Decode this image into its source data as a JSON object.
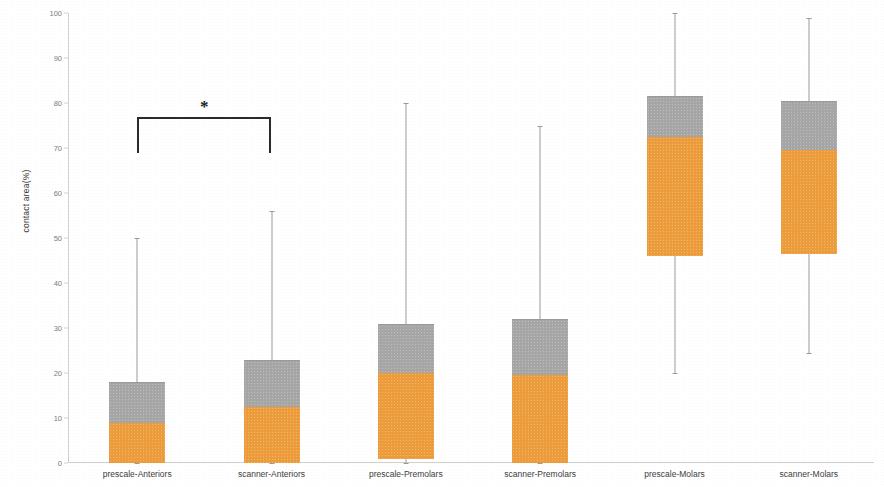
{
  "chart_data": {
    "type": "box",
    "title": "",
    "xlabel": "",
    "ylabel": "contact area(%)",
    "ylim": [
      0,
      100
    ],
    "ytick_step": 10,
    "yticks": [
      0,
      10,
      20,
      30,
      40,
      50,
      60,
      70,
      80,
      90,
      100
    ],
    "grid": false,
    "legend": "none",
    "colors": {
      "upper_box": "#a6a6a6",
      "lower_box": "#ed9c3c",
      "whisker": "#9b9b9b",
      "axis": "#d2d2d2",
      "tick_label": "#7d7d7d",
      "category_label": "#3c3c3c",
      "annotation": "#1d1d1d"
    },
    "categories": [
      "prescale-Anteriors",
      "scanner-Anteriors",
      "prescale-Premolars",
      "scanner-Premolars",
      "prescale-Molars",
      "scanner-Molars"
    ],
    "boxes": [
      {
        "category": "prescale-Anteriors",
        "whisker_low": 0,
        "q1": 0,
        "median": 9,
        "q3": 18,
        "whisker_high": 50
      },
      {
        "category": "scanner-Anteriors",
        "whisker_low": 0,
        "q1": 0,
        "median": 12.5,
        "q3": 23,
        "whisker_high": 56
      },
      {
        "category": "prescale-Premolars",
        "whisker_low": 0,
        "q1": 1,
        "median": 20,
        "q3": 31,
        "whisker_high": 80
      },
      {
        "category": "scanner-Premolars",
        "whisker_low": 0,
        "q1": 0,
        "median": 19.5,
        "q3": 32,
        "whisker_high": 75
      },
      {
        "category": "prescale-Molars",
        "whisker_low": 20,
        "q1": 46,
        "median": 72.5,
        "q3": 81.5,
        "whisker_high": 100
      },
      {
        "category": "scanner-Molars",
        "whisker_low": 24.5,
        "q1": 46.5,
        "median": 69.5,
        "q3": 80.5,
        "whisker_high": 99
      }
    ],
    "annotations": [
      {
        "type": "significance-bracket",
        "label": "*",
        "from_category": "prescale-Anteriors",
        "to_category": "scanner-Anteriors",
        "bar_y": 77,
        "leg_bottom_y": 69
      }
    ]
  }
}
